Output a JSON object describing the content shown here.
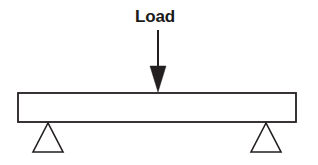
{
  "diagram": {
    "background_color": "#ffffff",
    "stroke_color": "#231f20",
    "fill_color": "#ffffff",
    "label": {
      "text": "Load",
      "x": 155,
      "y": 22,
      "font_size": 17,
      "bold": true,
      "color": "#1a1a1a"
    },
    "load_arrow": {
      "name": "downward-point-load-arrow",
      "shaft_x": 158,
      "shaft_top_y": 30,
      "shaft_bottom_y": 68,
      "shaft_width": 2,
      "head_left_x": 150,
      "head_right_x": 166,
      "head_top_y": 66,
      "tip_x": 158,
      "tip_y": 92,
      "color": "#231f20"
    },
    "beam": {
      "name": "beam-rectangle",
      "left": 18,
      "top": 93,
      "right": 296,
      "bottom": 122,
      "width": 278,
      "height": 29,
      "stroke_width": 1.8,
      "fill": "#ffffff",
      "stroke": "#231f20"
    },
    "supports": [
      {
        "name": "left-triangular-support",
        "apex_x": 48,
        "apex_y": 123,
        "base_left_x": 33,
        "base_right_x": 63,
        "base_y": 152,
        "stroke_width": 1.6,
        "fill": "#ffffff",
        "stroke": "#231f20"
      },
      {
        "name": "right-triangular-support",
        "apex_x": 266,
        "apex_y": 123,
        "base_left_x": 251,
        "base_right_x": 281,
        "base_y": 152,
        "stroke_width": 1.6,
        "fill": "#ffffff",
        "stroke": "#231f20"
      }
    ]
  }
}
